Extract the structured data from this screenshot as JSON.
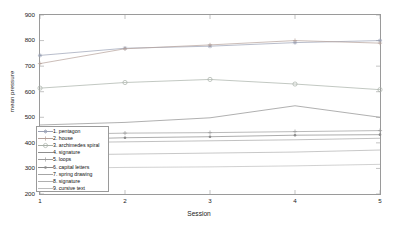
{
  "chart_data": {
    "type": "line",
    "title": "",
    "xlabel": "Session",
    "ylabel": "mean pressure",
    "x": [
      1,
      2,
      3,
      4,
      5
    ],
    "xlim": [
      1,
      5
    ],
    "ylim": [
      200,
      900
    ],
    "xticks": [
      "1",
      "2",
      "3",
      "4",
      "5"
    ],
    "yticks": [
      "200",
      "300",
      "400",
      "500",
      "600",
      "700",
      "800",
      "900"
    ],
    "grid": false,
    "legend_position": "lower-left-inside",
    "series": [
      {
        "name": "1. pentagon",
        "marker": "asterisk",
        "color": "#9aa0b4",
        "values": [
          742,
          770,
          778,
          792,
          800
        ]
      },
      {
        "name": "2. house",
        "marker": "plus",
        "color": "#b4a09a",
        "values": [
          710,
          768,
          783,
          800,
          790
        ]
      },
      {
        "name": "3. archimedes spiral",
        "marker": "circle",
        "color": "#a8b0a8",
        "values": [
          614,
          636,
          648,
          630,
          608
        ]
      },
      {
        "name": "4. signature",
        "marker": "none",
        "color": "#8e8e8e",
        "values": [
          470,
          480,
          498,
          545,
          500
        ]
      },
      {
        "name": "5. loops",
        "marker": "plus",
        "color": "#9c9c9c",
        "values": [
          432,
          438,
          440,
          444,
          448
        ]
      },
      {
        "name": "6. capital letters",
        "marker": "dot",
        "color": "#8a8a8a",
        "values": [
          412,
          420,
          424,
          430,
          432
        ]
      },
      {
        "name": "7. spring drawing",
        "marker": "none",
        "color": "#a6a6a6",
        "values": [
          400,
          404,
          408,
          412,
          418
        ]
      },
      {
        "name": "8. signature",
        "marker": "none",
        "color": "#b0b0b0",
        "values": [
          352,
          356,
          360,
          364,
          372
        ]
      },
      {
        "name": "9. cursive text",
        "marker": "none",
        "color": "#bdbdbd",
        "values": [
          300,
          304,
          306,
          310,
          316
        ]
      }
    ]
  },
  "axes": {
    "ylabel": "mean pressure",
    "xlabel": "Session",
    "yticks": [
      "900",
      "800",
      "700",
      "600",
      "500",
      "400",
      "300",
      "200"
    ],
    "xticks": [
      "1",
      "2",
      "3",
      "4",
      "5"
    ]
  },
  "legend": {
    "items": [
      {
        "label": "1. pentagon"
      },
      {
        "label": "2. house"
      },
      {
        "label": "3. archimedes spiral"
      },
      {
        "label": "4. signature"
      },
      {
        "label": "5. loops"
      },
      {
        "label": "6. capital letters"
      },
      {
        "label": "7. spring drawing"
      },
      {
        "label": "8. signature"
      },
      {
        "label": "9. cursive text"
      }
    ]
  }
}
